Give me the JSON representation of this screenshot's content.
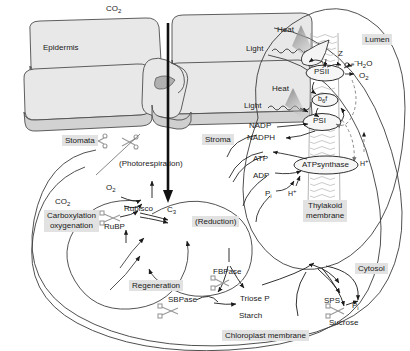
{
  "diagram": {
    "colors": {
      "cell_fill": "#e8e8e8",
      "cell_stroke": "#4d4d4d",
      "label_box_bg": "#e2e2e2",
      "line": "#1a1a1a",
      "scissors": "#9a9a9a",
      "membrane": "#b8b8b8"
    }
  },
  "leaf": {
    "co2_label": "CO",
    "co2_sub": "2",
    "epidermis_label": "Epidermis",
    "stomata_label": "Stomata"
  },
  "stroma": {
    "stroma_label": "Stroma",
    "photorespiration_label": "(Photorespiration)",
    "co2_label": "CO",
    "co2_sub": "2",
    "o2_label": "O",
    "o2_sub": "2",
    "rubisco_label": "Rubisco",
    "rubp_label": "RuBP",
    "carbon3_label": "C",
    "carbon3_sub": "3",
    "carboxylation_line1": "Carboxylation",
    "carboxylation_line2": "oxygenation",
    "reduction_label": "(Reduction)",
    "regeneration_label": "Regeneration",
    "fbpase_label": "FBPase",
    "sbpase_label": "SBPase",
    "triose_p_label": "Triose P",
    "starch_label": "Starch",
    "chloroplast_membrane_label": "Chloroplast membrane"
  },
  "thylakoid": {
    "lumen_label": "Lumen",
    "heat_label_1": "Heat",
    "heat_label_2": "Heat",
    "light_label_1": "Light",
    "light_label_2": "Light",
    "z_label": "Z",
    "y_label": "y",
    "electron_label": "e",
    "electron_sup": "–",
    "psii_label": "PSII",
    "psi_label": "PSI",
    "b6f_label": "b",
    "b6f_sub": "6",
    "b6f_tail": "f",
    "h2o_label": "H",
    "h2o_sub": "2",
    "h2o_tail": "O",
    "o2_label": "O",
    "o2_sub": "2",
    "nadp_label": "NADP",
    "nadph_label": "NADPH",
    "atp_label": "ATP",
    "adp_label": "ADP",
    "pi_label": "P",
    "pi_sub": "i",
    "atpsynthase_label": "ATPsynthase",
    "proton_label_1": "H",
    "proton_sup_1": "+",
    "proton_label_2": "H",
    "proton_sup_2": "+",
    "membrane_line1": "Thylakoid",
    "membrane_line2": "membrane"
  },
  "cytosol": {
    "cytosol_label": "Cytosol",
    "sps_label": "SPS",
    "sucrose_label": "Sucrose",
    "pi_label": "P",
    "pi_sub": "i"
  }
}
